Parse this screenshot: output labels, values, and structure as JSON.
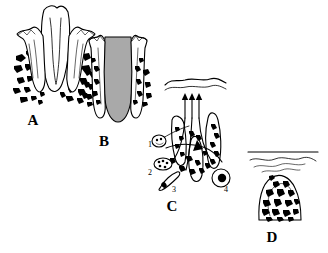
{
  "figure": {
    "kind": "scientific-line-drawing",
    "background_color": "#ffffff",
    "ink_color": "#000000",
    "gray_fill_color": "#a9a9a9",
    "panels": [
      {
        "id": "A",
        "label": "A",
        "label_x": 33,
        "label_y": 125,
        "description": "Tooth in cross-section with crown, roots and surrounding speckled bone"
      },
      {
        "id": "B",
        "label": "B",
        "label_x": 104,
        "label_y": 146,
        "description": "Gray-filled tapered structure flanked by speckled bone and gingival crests"
      },
      {
        "id": "C",
        "label": "C",
        "label_x": 172,
        "label_y": 211,
        "description": "Detail of cellular elements with four numbered callouts and three upward arrows to a wavy surface"
      },
      {
        "id": "D",
        "label": "D",
        "label_x": 272,
        "label_y": 242,
        "description": "Dome-shaped speckled mass beneath a straight line and wavy lines"
      }
    ],
    "callouts": [
      {
        "num": "1",
        "x": 148,
        "y": 147,
        "target": "small round cell, upper left"
      },
      {
        "num": "2",
        "x": 148,
        "y": 175,
        "target": "cluster of small granular cells"
      },
      {
        "num": "3",
        "x": 172,
        "y": 192,
        "target": "elongated spindle cell"
      },
      {
        "num": "4",
        "x": 224,
        "y": 192,
        "target": "large round cell with dark nucleus"
      }
    ],
    "arrows": {
      "count": 3,
      "direction": "up",
      "panel": "C"
    }
  }
}
